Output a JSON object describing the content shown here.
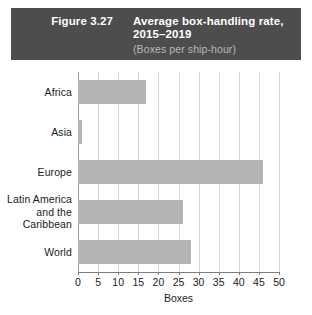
{
  "header": {
    "figure_number": "Figure 3.27",
    "title": "Average box-handling rate,\n2015–2019",
    "subtitle": "(Boxes per ship-hour)",
    "background_color": "#4d4d4d",
    "title_color": "#ffffff",
    "subtitle_color": "#b8b8b8"
  },
  "chart_data": {
    "type": "bar",
    "orientation": "horizontal",
    "title": "Average box-handling rate, 2015–2019",
    "subtitle": "(Boxes per ship-hour)",
    "categories": [
      "Africa",
      "Asia",
      "Europe",
      "Latin America and the Caribbean",
      "World"
    ],
    "category_labels": [
      "Africa",
      "Asia",
      "Europe",
      "Latin America\nand the\nCaribbean",
      "World"
    ],
    "values": [
      17,
      1,
      46,
      26,
      28
    ],
    "xlabel": "Boxes",
    "ylabel": "",
    "xlim": [
      0,
      50
    ],
    "xticks": [
      0,
      5,
      10,
      15,
      20,
      25,
      30,
      35,
      40,
      45,
      50
    ],
    "xtick_labels": [
      "0",
      "5",
      "10",
      "15",
      "20",
      "25",
      "30",
      "35",
      "40",
      "45",
      "50"
    ],
    "grid": true,
    "grid_axis": "x",
    "legend": false,
    "bar_color": "#b4b4b4",
    "gridline_color": "#d6d6d6",
    "axis_color": "#7d7d7d"
  }
}
